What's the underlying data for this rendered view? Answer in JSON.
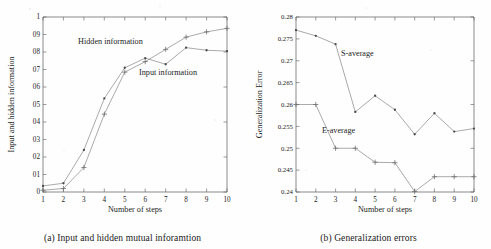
{
  "figures": [
    {
      "id": "figure-a",
      "caption": "(a) Input and hidden mutual inforamtion",
      "chart_data": {
        "type": "line",
        "title": "",
        "xlabel": "Number of steps",
        "ylabel": "Input and hidden information",
        "x": [
          1,
          2,
          3,
          4,
          5,
          6,
          7,
          8,
          9,
          10
        ],
        "xticklabels": [
          "1",
          "2",
          "3",
          "4",
          "5",
          "6",
          "7",
          "8",
          "9",
          "10"
        ],
        "yticks": [
          0,
          0.1,
          0.2,
          0.3,
          0.4,
          0.5,
          0.6,
          0.7,
          0.8,
          0.9,
          1
        ],
        "yticklabels": [
          "0",
          "01",
          "02",
          "03",
          "04",
          "05",
          "06",
          "07",
          "08",
          "09",
          "1"
        ],
        "xlim": [
          1,
          10
        ],
        "ylim": [
          0,
          1
        ],
        "grid": false,
        "legend_position": "in-plot annotations",
        "series": [
          {
            "name": "Hidden information",
            "marker": "dot",
            "label_text": "Hidden information",
            "values": [
              0.035,
              0.05,
              0.24,
              0.535,
              0.71,
              0.765,
              0.73,
              0.825,
              0.81,
              0.805
            ]
          },
          {
            "name": "Input information",
            "marker": "plus",
            "label_text": "Input information",
            "values": [
              0.01,
              0.02,
              0.14,
              0.445,
              0.685,
              0.745,
              0.815,
              0.885,
              0.915,
              0.935
            ]
          }
        ]
      }
    },
    {
      "id": "figure-b",
      "caption": "(b) Generalization errors",
      "chart_data": {
        "type": "line",
        "title": "",
        "xlabel": "Number of steps",
        "ylabel": "Generalization Error",
        "x": [
          1,
          2,
          3,
          4,
          5,
          6,
          7,
          8,
          9,
          10
        ],
        "xticklabels": [
          "1",
          "2",
          "3",
          "4",
          "5",
          "6",
          "7",
          "8",
          "9",
          "10"
        ],
        "yticks": [
          0.24,
          0.245,
          0.25,
          0.255,
          0.26,
          0.265,
          0.27,
          0.275,
          0.28
        ],
        "yticklabels": [
          "0.24",
          "0.245",
          "0.25",
          "0.255",
          "0.26",
          "0.265",
          "0.27",
          "0.275",
          "0.28"
        ],
        "xlim": [
          1,
          10
        ],
        "ylim": [
          0.24,
          0.28
        ],
        "grid": false,
        "legend_position": "in-plot annotations",
        "series": [
          {
            "name": "S-average",
            "marker": "dot",
            "label_text": "S-average",
            "values": [
              0.277,
              0.2757,
              0.2738,
              0.2583,
              0.262,
              0.2588,
              0.2532,
              0.258,
              0.2538,
              0.2545
            ]
          },
          {
            "name": "E-average",
            "marker": "plus",
            "label_text": "E-average",
            "values": [
              0.26,
              0.26,
              0.25,
              0.25,
              0.2468,
              0.2467,
              0.2401,
              0.2435,
              0.2435,
              0.2435
            ]
          }
        ]
      }
    }
  ]
}
